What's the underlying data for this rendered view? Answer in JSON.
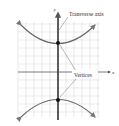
{
  "diagram": {
    "axes": {
      "x_label": "x",
      "y_label": "y"
    },
    "annotations": {
      "transverse_axis": "Transverse axis",
      "vertices": "Vertices"
    },
    "colors": {
      "grid": "#dcdcdc",
      "axis": "#555555",
      "curve": "#666666",
      "transverse_axis": "#333333",
      "vertex": "#111111",
      "leader": "#888888"
    }
  }
}
